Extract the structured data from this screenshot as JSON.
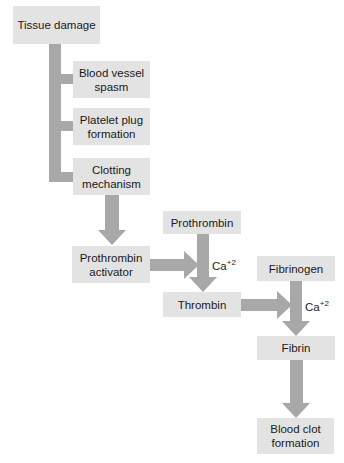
{
  "diagram": {
    "nodes": {
      "tissue_damage": "Tissue damage",
      "blood_vessel_spasm": "Blood vessel spasm",
      "platelet_plug": "Platelet plug formation",
      "clotting_mechanism": "Clotting mechanism",
      "prothrombin_activator": "Prothrombin activator",
      "prothrombin": "Prothrombin",
      "thrombin": "Thrombin",
      "fibrinogen": "Fibrinogen",
      "fibrin": "Fibrin",
      "blood_clot": "Blood clot formation"
    },
    "labels": {
      "ca_base": "Ca",
      "ca_charge": "+2"
    },
    "colors": {
      "box_fill": "#e3e3e3",
      "connector": "#a8a8a8",
      "background": "#ffffff"
    },
    "edges": [
      {
        "from": "Tissue damage",
        "to": "Blood vessel spasm"
      },
      {
        "from": "Tissue damage",
        "to": "Platelet plug formation"
      },
      {
        "from": "Tissue damage",
        "to": "Clotting mechanism"
      },
      {
        "from": "Clotting mechanism",
        "to": "Prothrombin activator"
      },
      {
        "from": "Prothrombin activator",
        "to": "Prothrombin → Thrombin"
      },
      {
        "from": "Prothrombin",
        "to": "Thrombin",
        "label": "Ca+2"
      },
      {
        "from": "Thrombin",
        "to": "Fibrinogen → Fibrin"
      },
      {
        "from": "Fibrinogen",
        "to": "Fibrin",
        "label": "Ca+2"
      },
      {
        "from": "Fibrin",
        "to": "Blood clot formation"
      }
    ]
  }
}
